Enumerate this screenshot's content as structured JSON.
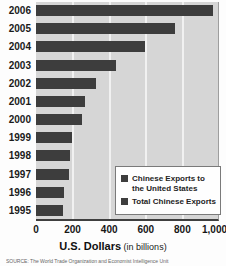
{
  "chart_data": {
    "type": "bar",
    "orientation": "horizontal",
    "categories": [
      "2006",
      "2005",
      "2004",
      "2003",
      "2002",
      "2001",
      "2000",
      "1999",
      "1998",
      "1997",
      "1996",
      "1995"
    ],
    "series": [
      {
        "name": "Total Chinese Exports",
        "values": [
          969,
          762,
          593,
          438,
          326,
          266,
          249,
          195,
          184,
          183,
          151,
          149
        ]
      }
    ],
    "legend": [
      {
        "label": "Chinese Exports to the United States",
        "color": "#3d3d3d"
      },
      {
        "label": "Total Chinese Exports",
        "color": "#3d3d3d"
      }
    ],
    "legend_position": "lower right",
    "xlabel_primary": "U.S. Dollars",
    "xlabel_secondary": "(in billions)",
    "xlim": [
      0,
      1000
    ],
    "x_ticks": [
      "0",
      "200",
      "400",
      "600",
      "800",
      "1,000"
    ],
    "grid": true,
    "bar_color": "#3d3d3d",
    "panel_color": "#d6d6d6"
  },
  "axis": {
    "title_bold": "U.S. Dollars",
    "title_note": " (in billions)"
  },
  "source_text": "SOURCE: The World Trade Organization and Economist Intelligence Unit"
}
